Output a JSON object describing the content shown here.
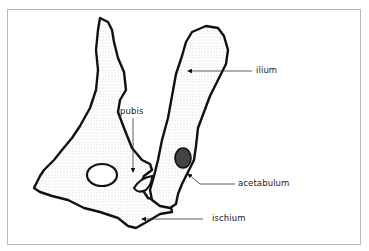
{
  "diagram": {
    "labels": [
      {
        "id": "ilium",
        "text": "ilium"
      },
      {
        "id": "pubis",
        "text": "pubis"
      },
      {
        "id": "acetabulum",
        "text": "acetabulum"
      },
      {
        "id": "ischium",
        "text": "ischium"
      }
    ],
    "colors": {
      "outline": "#111111",
      "frame": "#b8b8b8",
      "background": "#ffffff"
    }
  }
}
